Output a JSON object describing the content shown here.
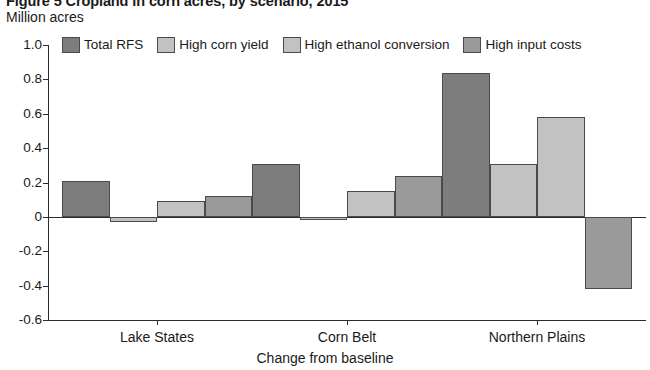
{
  "figure": {
    "title": "Figure 5  Cropland in corn acres, by scenario, 2015",
    "subtitle": "Million acres"
  },
  "legend": {
    "position": "top",
    "items": [
      {
        "label": "Total RFS",
        "color": "#7d7d7d",
        "name": "legend-total-rfs"
      },
      {
        "label": "High corn yield",
        "color": "#c2c2c2",
        "name": "legend-high-corn-yield"
      },
      {
        "label": "High ethanol conversion",
        "color": "#c2c2c2",
        "name": "legend-high-ethanol-conversion"
      },
      {
        "label": "High input costs",
        "color": "#9a9a9a",
        "name": "legend-high-input-costs"
      }
    ]
  },
  "axes": {
    "y_ticks": [
      "1.0",
      "0.8",
      "0.6",
      "0.4",
      "0.2",
      "0",
      "-0.2",
      "-0.4",
      "-0.6"
    ],
    "y_label": "Million acres",
    "x_label": "Change from baseline",
    "x_ticks": [
      "Lake States",
      "Corn Belt",
      "Northern Plains"
    ]
  },
  "chart_data": {
    "type": "bar",
    "title": "Figure 5  Cropland in corn acres, by scenario, 2015",
    "subtitle": "Million acres",
    "xlabel": "Change from baseline",
    "ylabel": "Million acres",
    "ylim": [
      -0.6,
      1.0
    ],
    "ytick_step": 0.2,
    "grid": false,
    "legend_position": "top",
    "categories": [
      "Lake States",
      "Corn Belt",
      "Northern Plains"
    ],
    "series": [
      {
        "name": "Total RFS",
        "color": "#7d7d7d",
        "values": [
          0.21,
          0.31,
          0.84
        ]
      },
      {
        "name": "High corn yield",
        "color": "#c2c2c2",
        "values": [
          -0.03,
          -0.02,
          0.31
        ]
      },
      {
        "name": "High ethanol conversion",
        "color": "#c2c2c2",
        "values": [
          0.09,
          0.15,
          0.58
        ]
      },
      {
        "name": "High input costs",
        "color": "#9a9a9a",
        "values": [
          0.12,
          0.24,
          -0.42
        ]
      }
    ]
  }
}
